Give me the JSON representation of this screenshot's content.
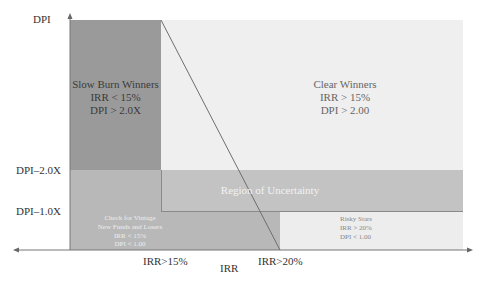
{
  "diagram": {
    "colors": {
      "background": "#ffffff",
      "slow_burn": "#9a9a9a",
      "clear_winners": "#efefef",
      "lower_left": "#b8b8b8",
      "uncertainty": "#c3c3c3",
      "risky_stars": "#ededed",
      "axis": "#777777",
      "diagonal": "#6e6e6e"
    },
    "y_axis": {
      "title": "DPI",
      "ticks": [
        "DPI–2.0X",
        "DPI–1.0X"
      ]
    },
    "x_axis": {
      "title": "IRR",
      "ticks": [
        "IRR>15%",
        "IRR>20%"
      ]
    },
    "regions": {
      "slow_burn": {
        "lines": [
          "Slow Burn Winners",
          "IRR < 15%",
          "DPI > 2.0X"
        ]
      },
      "clear_winners": {
        "lines": [
          "Clear Winners",
          "IRR > 15%",
          "DPI > 2.00"
        ]
      },
      "uncertainty": {
        "lines": [
          "Region of Uncertainty"
        ]
      },
      "vintage": {
        "lines": [
          "Check for Vintage",
          "New Funds and Losers",
          "IRR < 15%",
          "DPI < 1.00"
        ]
      },
      "risky_stars": {
        "lines": [
          "Risky Stars",
          "IRR > 20%",
          "DPI < 1.00"
        ]
      }
    }
  }
}
